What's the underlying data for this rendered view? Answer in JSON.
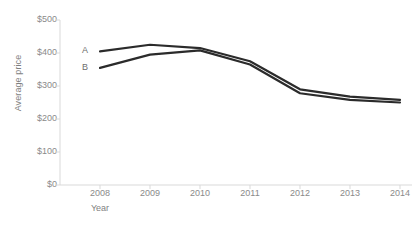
{
  "chart_data": {
    "type": "line",
    "title": "",
    "xlabel": "Year",
    "ylabel": "Average price",
    "categories": [
      "2008",
      "2009",
      "2010",
      "2011",
      "2012",
      "2013",
      "2014"
    ],
    "x": [
      2008,
      2009,
      2010,
      2011,
      2012,
      2013,
      2014
    ],
    "xlim": [
      2008,
      2014
    ],
    "ylim": [
      0,
      500
    ],
    "ytick_labels": [
      "$0",
      "$100",
      "$200",
      "$300",
      "$400",
      "$500"
    ],
    "ytick_values": [
      0,
      100,
      200,
      300,
      400,
      500
    ],
    "grid": false,
    "legend_position": "inline-left",
    "series": [
      {
        "name": "A",
        "color": "#2b2b2b",
        "values": [
          405,
          425,
          415,
          375,
          290,
          268,
          258
        ]
      },
      {
        "name": "B",
        "color": "#2b2b2b",
        "values": [
          355,
          395,
          408,
          365,
          278,
          258,
          250
        ]
      }
    ]
  },
  "axes": {
    "y_title": "Average price",
    "x_title": "Year",
    "axis_color": "#d9d9d9",
    "tick_color": "#8a8a8a"
  }
}
